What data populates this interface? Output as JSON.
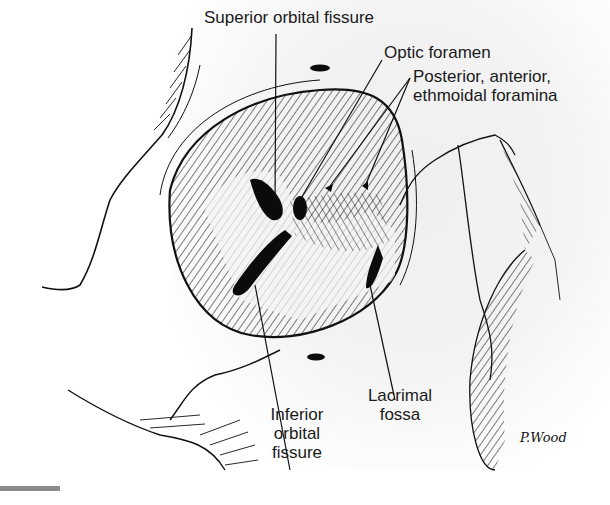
{
  "figure": {
    "labels": {
      "superior_orbital_fissure": "Superior orbital fissure",
      "optic_foramen": "Optic foramen",
      "ethmoidal_foramina_line1": "Posterior, anterior,",
      "ethmoidal_foramina_line2": "ethmoidal foramina",
      "inferior_orbital_fissure_line1": "Inferior",
      "inferior_orbital_fissure_line2": "orbital",
      "inferior_orbital_fissure_line3": "fissure",
      "lacrimal_fossa_line1": "Lacrimal",
      "lacrimal_fossa_line2": "fossa"
    },
    "signature": "P.Wood",
    "colors": {
      "ink": "#111111",
      "paper": "#f2f2f2",
      "scalebar": "#8a8a8a"
    }
  }
}
